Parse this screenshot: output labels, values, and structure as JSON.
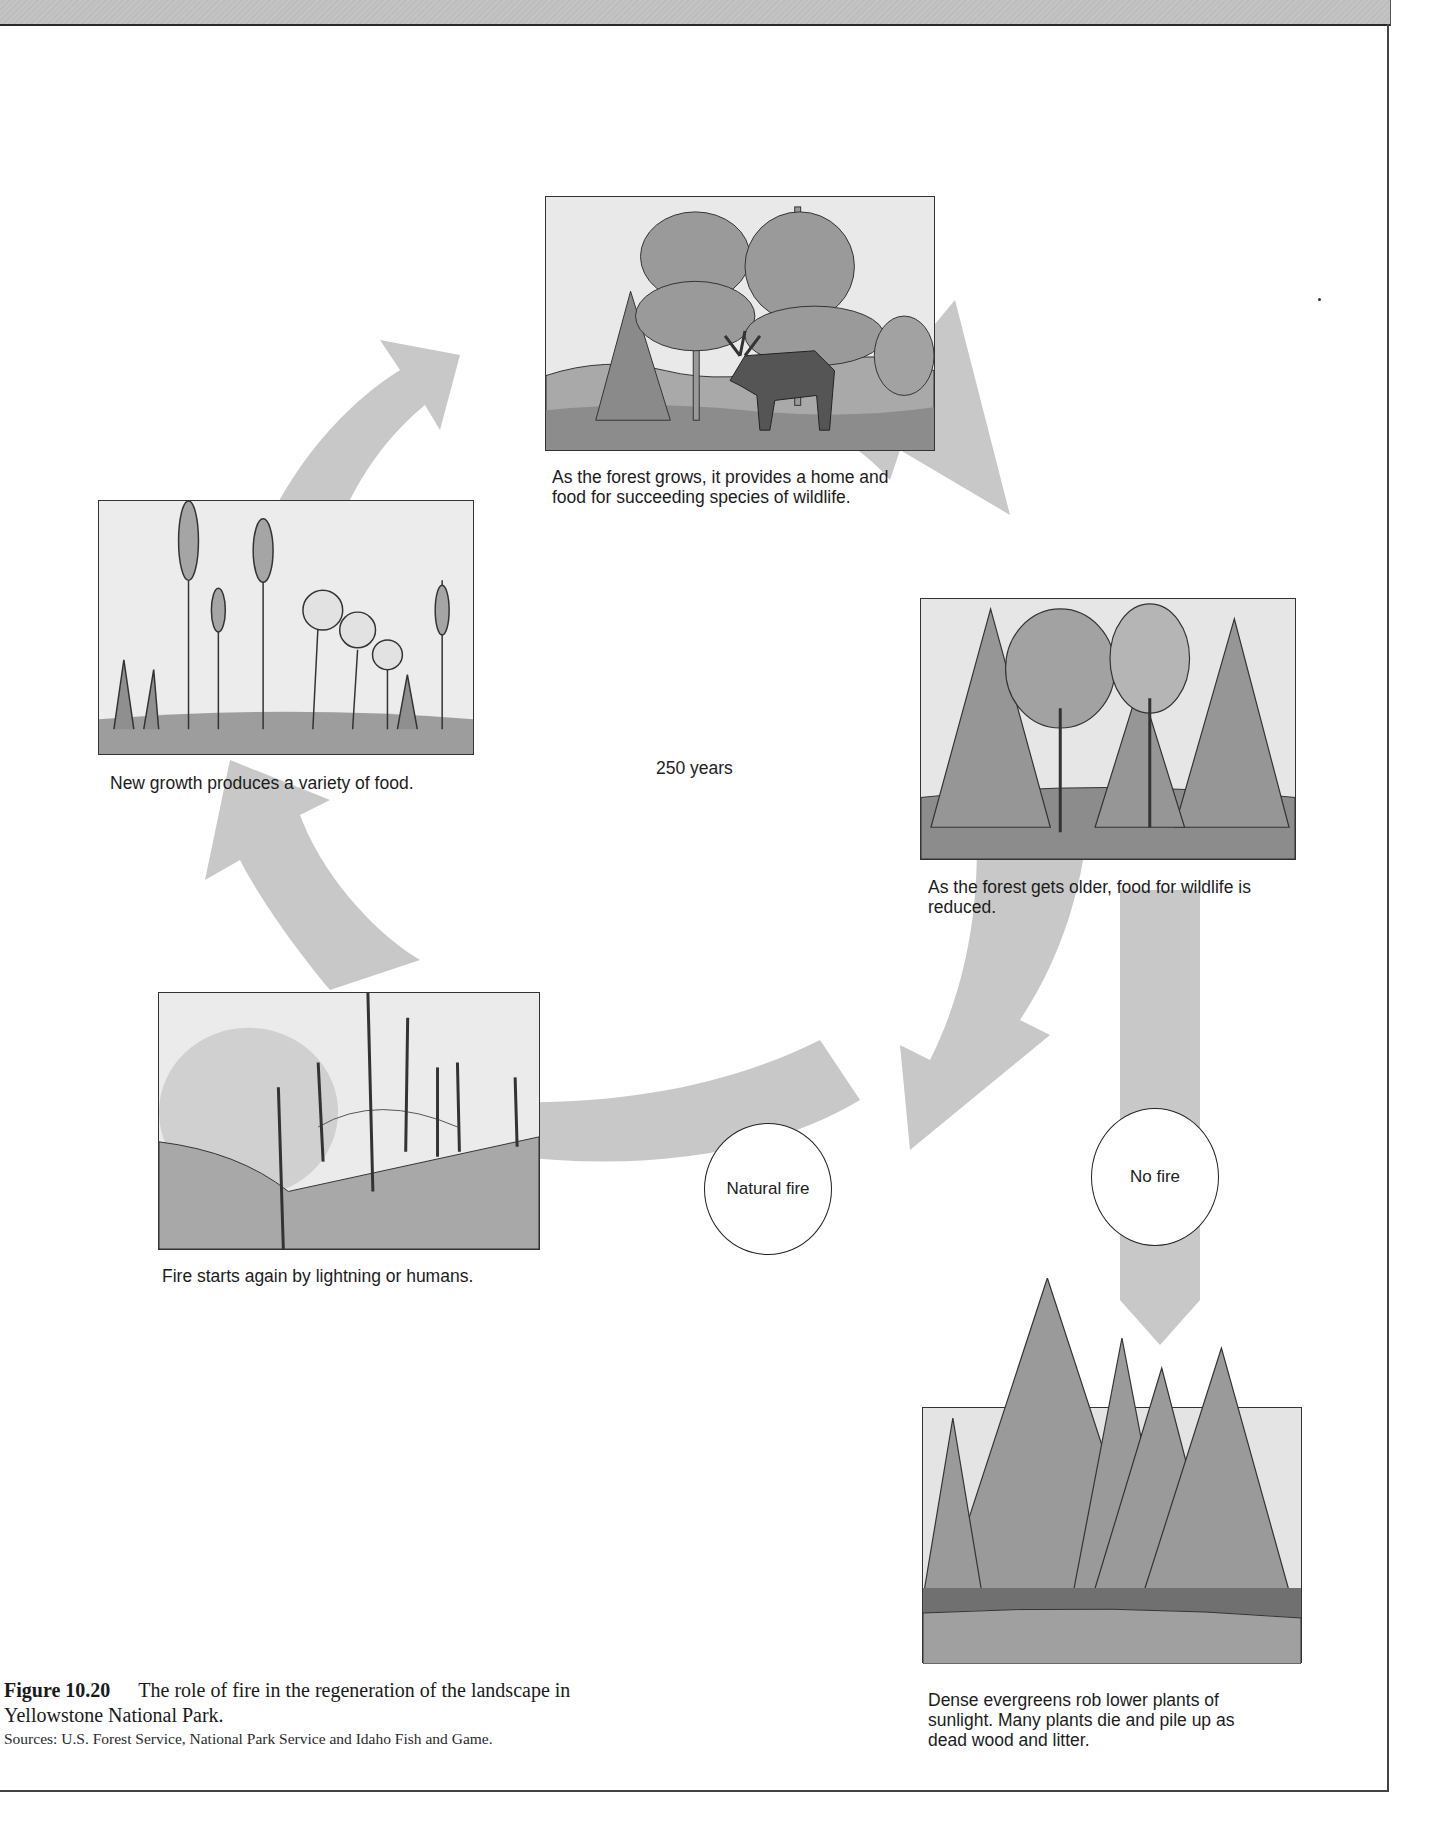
{
  "figure": {
    "number": "Figure 10.20",
    "title": "The role of fire in the regeneration of the landscape in Yellowstone National Park.",
    "sources": "Sources: U.S. Forest Service, National Park Service and Idaho Fish and Game."
  },
  "cycle": {
    "center_label": "250 years",
    "arrow_color": "#c8c8c8",
    "stages": [
      {
        "id": "growing-forest",
        "caption": "As the forest grows, it provides a home and food for succeeding species of wildlife.",
        "illustration": "moose-in-young-forest"
      },
      {
        "id": "older-forest",
        "caption": "As the forest gets older, food for wildlife is reduced.",
        "illustration": "mature-mixed-forest"
      },
      {
        "id": "dense-evergreens",
        "caption": "Dense evergreens rob lower plants of sunlight. Many plants die and pile up as dead wood and litter.",
        "illustration": "dense-conifer-forest"
      },
      {
        "id": "fire",
        "caption": "Fire starts again by lightning or humans.",
        "illustration": "burned-snags-and-smoke"
      },
      {
        "id": "new-growth",
        "caption": "New growth produces a variety of food.",
        "illustration": "wildflowers-and-grasses"
      }
    ],
    "decisions": [
      {
        "id": "natural-fire",
        "label": "Natural fire"
      },
      {
        "id": "no-fire",
        "label": "No fire"
      }
    ]
  }
}
